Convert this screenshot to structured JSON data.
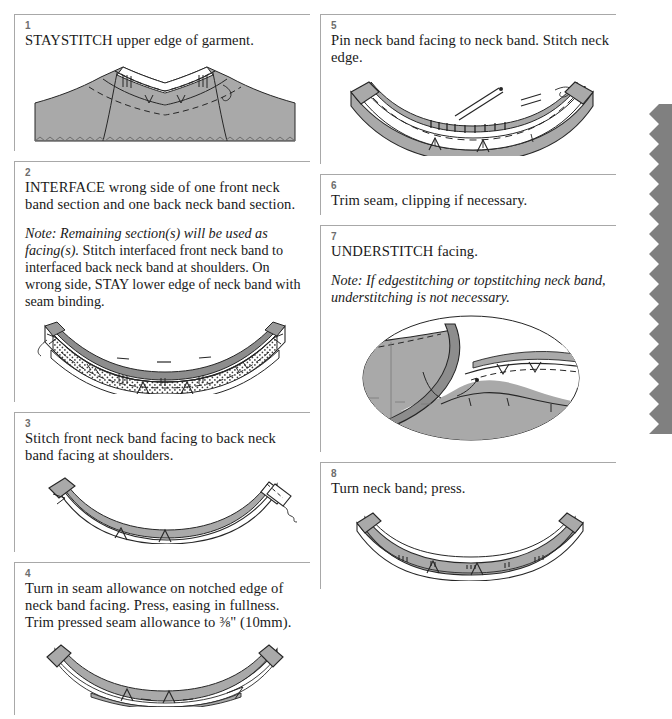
{
  "document": {
    "title": "Neck Band Construction Instructions",
    "kind": "sewing-pattern-instruction-sheet"
  },
  "colors": {
    "fabric_gray": "#a9a9a9",
    "fabric_gray_dark": "#8d8d8d",
    "panel_rule": "#a8a8a8",
    "step_number": "#6d6d6d",
    "ink": "#1a1a1a",
    "strip_gray": "#808080"
  },
  "left_column": [
    {
      "number": "1",
      "text": "STAYSTITCH upper edge of garment.",
      "note": "",
      "figure": "garment-neckline-staystitch"
    },
    {
      "number": "2",
      "text": "INTERFACE wrong side of one front neck band section and one back neck band section.",
      "note_lead": "Note: Remaining section(s) will be used as facing(s).",
      "note_rest": " Stitch interfaced front neck band to interfaced back neck band at shoulders. On wrong side, STAY lower edge of neck band with seam binding.",
      "figure": "interfaced-neck-band-curve"
    },
    {
      "number": "3",
      "text": "Stitch front neck band facing to back neck band facing at shoulders.",
      "note": "",
      "figure": "neck-band-facing-joined"
    },
    {
      "number": "4",
      "text": "Turn in seam allowance on notched edge of neck band facing. Press, easing in fullness. Trim pressed seam allowance to ⅜\" (10mm).",
      "note": "",
      "figure": "pressed-seam-allowance-band"
    }
  ],
  "right_column": [
    {
      "number": "5",
      "text": "Pin neck band facing to neck band. Stitch neck edge.",
      "note": "",
      "figure": "pinned-neck-band-facing"
    },
    {
      "number": "6",
      "text": "Trim seam, clipping if necessary.",
      "note": "",
      "figure": "none"
    },
    {
      "number": "7",
      "text": "UNDERSTITCH facing.",
      "note_lead": "Note: If edgestitching or topstitching neck band, understitching is not necessary.",
      "note_rest": "",
      "figure": "understitch-detail-oval"
    },
    {
      "number": "8",
      "text": "Turn neck band; press.",
      "note": "",
      "figure": "turned-neck-band"
    }
  ],
  "decoration": {
    "pinked_strip_label": "pinked-edge-strip"
  }
}
